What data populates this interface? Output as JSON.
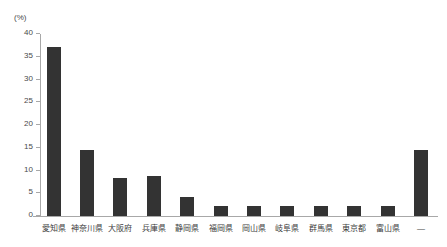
{
  "chart_data": {
    "type": "bar",
    "title": "",
    "xlabel": "",
    "ylabel": "(%)",
    "unit_label": "(%)",
    "ylim": [
      0,
      40
    ],
    "ytick_step": 5,
    "yticks": [
      40,
      35,
      30,
      25,
      20,
      15,
      10,
      5,
      0
    ],
    "ytick_labels": [
      "40",
      "35",
      "30",
      "25",
      "20",
      "15",
      "10",
      "5",
      "0"
    ],
    "grid": false,
    "legend": false,
    "bar_color": "#333333",
    "axis_color": "#a8a8a8",
    "categories": [
      "愛知県",
      "神奈川県",
      "大阪府",
      "兵庫県",
      "静岡県",
      "福岡県",
      "岡山県",
      "岐阜県",
      "群馬県",
      "東京都",
      "富山県",
      "—"
    ],
    "values": [
      37.2,
      14.6,
      8.3,
      8.9,
      4.2,
      2.3,
      2.3,
      2.3,
      2.3,
      2.3,
      2.3,
      14.6
    ]
  }
}
